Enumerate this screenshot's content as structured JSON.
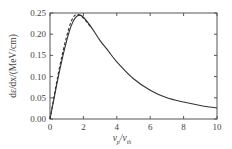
{
  "chart_data": {
    "type": "line",
    "title": "",
    "xlabel": "v_p/v_th",
    "ylabel": "dε/dx/(MeV/cm)",
    "xlim": [
      0,
      10
    ],
    "ylim": [
      0,
      0.25
    ],
    "grid": false,
    "legend": null,
    "x_ticks": [
      "0",
      "2",
      "4",
      "6",
      "8",
      "10"
    ],
    "y_ticks": [
      "0.00",
      "0.05",
      "0.10",
      "0.15",
      "0.20",
      "0.25"
    ],
    "series": [
      {
        "name": "solid",
        "style": "solid",
        "x": [
          0,
          0.25,
          0.5,
          0.75,
          1.0,
          1.25,
          1.5,
          1.75,
          2.0,
          2.5,
          3.0,
          3.5,
          4.0,
          5.0,
          6.0,
          7.0,
          8.0,
          9.0,
          10.0
        ],
        "y": [
          0.0,
          0.05,
          0.1,
          0.145,
          0.185,
          0.218,
          0.238,
          0.245,
          0.24,
          0.215,
          0.185,
          0.16,
          0.135,
          0.095,
          0.068,
          0.05,
          0.04,
          0.032,
          0.026
        ]
      },
      {
        "name": "dashed",
        "style": "dashed",
        "x": [
          0,
          0.25,
          0.5,
          0.75,
          1.0,
          1.25,
          1.5,
          1.75,
          2.0,
          2.5
        ],
        "y": [
          0.0,
          0.055,
          0.108,
          0.155,
          0.195,
          0.228,
          0.245,
          0.246,
          0.238,
          0.214
        ]
      }
    ]
  },
  "labels": {
    "xlabel_main": "v",
    "xlabel_sub1": "p",
    "xlabel_mid": "/v",
    "xlabel_sub2": "th",
    "ylabel": "dε/dx/(MeV/cm)"
  }
}
